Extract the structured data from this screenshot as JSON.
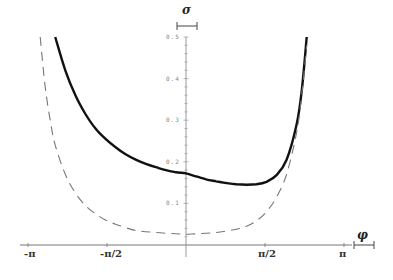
{
  "chart_data": {
    "type": "line",
    "title": "",
    "xlabel": "φ",
    "ylabel": "σ",
    "xlim": [
      -3.3,
      3.3
    ],
    "ylim": [
      0,
      0.5
    ],
    "grid": false,
    "legend": null,
    "x_ticks": [
      {
        "value": -3.14159,
        "label": "-π"
      },
      {
        "value": -1.5708,
        "label": "-π/2"
      },
      {
        "value": 1.5708,
        "label": "π/2"
      },
      {
        "value": 3.14159,
        "label": "π"
      }
    ],
    "y_ticks": [
      {
        "value": 0.1,
        "label": "0.1"
      },
      {
        "value": 0.2,
        "label": "0.2"
      },
      {
        "value": 0.3,
        "label": "0.3"
      },
      {
        "value": 0.4,
        "label": "0.4"
      },
      {
        "value": 0.5,
        "label": "0.5"
      }
    ],
    "series": [
      {
        "name": "solid",
        "style": "solid",
        "color": "#111111",
        "x": [
          -2.6,
          -2.4,
          -2.2,
          -2.0,
          -1.8,
          -1.6,
          -1.4,
          -1.2,
          -1.0,
          -0.8,
          -0.6,
          -0.4,
          -0.2,
          0.0,
          0.2,
          0.4,
          0.6,
          0.8,
          1.0,
          1.2,
          1.4,
          1.6,
          1.8,
          2.0,
          2.2,
          2.3,
          2.4
        ],
        "y": [
          0.5,
          0.42,
          0.36,
          0.315,
          0.28,
          0.255,
          0.235,
          0.218,
          0.205,
          0.195,
          0.187,
          0.18,
          0.175,
          0.172,
          0.165,
          0.158,
          0.153,
          0.149,
          0.146,
          0.145,
          0.146,
          0.152,
          0.168,
          0.205,
          0.29,
          0.37,
          0.5
        ]
      },
      {
        "name": "dashed",
        "style": "dashed",
        "color": "#777777",
        "x": [
          -2.9,
          -2.8,
          -2.7,
          -2.6,
          -2.4,
          -2.2,
          -2.0,
          -1.8,
          -1.6,
          -1.4,
          -1.2,
          -1.0,
          -0.6,
          -0.2,
          0.0,
          0.2,
          0.6,
          1.0,
          1.2,
          1.4,
          1.6,
          1.8,
          2.0,
          2.2,
          2.3,
          2.4
        ],
        "y": [
          0.5,
          0.38,
          0.3,
          0.24,
          0.17,
          0.125,
          0.095,
          0.075,
          0.06,
          0.05,
          0.042,
          0.035,
          0.03,
          0.027,
          0.026,
          0.027,
          0.03,
          0.038,
          0.045,
          0.058,
          0.08,
          0.115,
          0.17,
          0.27,
          0.36,
          0.48
        ]
      }
    ]
  },
  "axes": {
    "x_name": "φ",
    "y_name": "σ"
  }
}
